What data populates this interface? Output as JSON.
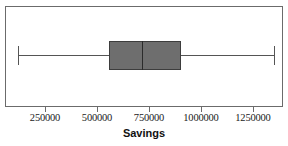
{
  "chart_data": {
    "type": "box",
    "title": "",
    "xlabel": "Savings",
    "ylabel": "",
    "orientation": "horizontal",
    "grid": false,
    "legend": null,
    "xlim": [
      0,
      1400000
    ],
    "xticks": [
      250000,
      500000,
      750000,
      1000000,
      1250000
    ],
    "xtick_labels": [
      "250000",
      "500000",
      "750000",
      "1000000",
      "1250000"
    ],
    "series": [
      {
        "name": "Savings",
        "min": 115000,
        "q1": 553000,
        "median": 712000,
        "q3": 899000,
        "max": 1346000,
        "outliers": []
      }
    ]
  },
  "axis": {
    "title": "Savings",
    "tick_labels": [
      "250000",
      "500000",
      "750000",
      "1000000",
      "1250000"
    ]
  },
  "style": {
    "frame_color": "#6b6b6b",
    "box_fill": "#6e6e6e",
    "box_border": "#3d3d3d",
    "median_color": "#2b2b2b",
    "whisker_color": "#555555",
    "background": "#ffffff",
    "text_color": "#1a1a1a"
  }
}
